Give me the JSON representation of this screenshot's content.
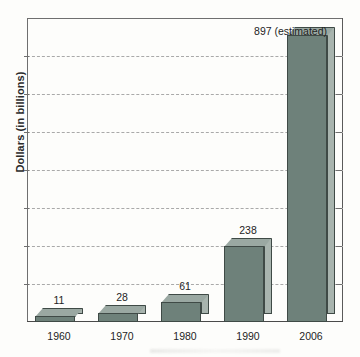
{
  "chart_data": {
    "type": "bar",
    "title": "",
    "subtitle": "",
    "xlabel": "",
    "ylabel": "Dollars (in billions)",
    "categories": [
      "1960",
      "1970",
      "1980",
      "1990",
      "2006"
    ],
    "values": [
      11,
      28,
      61,
      238,
      897
    ],
    "value_labels": [
      "11",
      "28",
      "61",
      "238",
      "897 (estimated)"
    ],
    "ylim": [
      0,
      950
    ],
    "gridlines": 7,
    "grid": true,
    "grid_style": "dashed",
    "legend": "none",
    "annotations": [
      "897 (estimated)"
    ],
    "style": "3d-bars",
    "series": [
      {
        "name": "Dollars (in billions)",
        "values": [
          11,
          28,
          61,
          238,
          897
        ]
      }
    ]
  },
  "colors": {
    "bar_front": "#6e817a",
    "bar_side": "#a8b4ae",
    "bar_top": "#9aa8a2",
    "bar_outline": "#3f4a46",
    "gridline": "#a9a9a9",
    "axis": "#6f6f6f",
    "text": "#1e1e1e",
    "background": "#fdfdfb"
  }
}
